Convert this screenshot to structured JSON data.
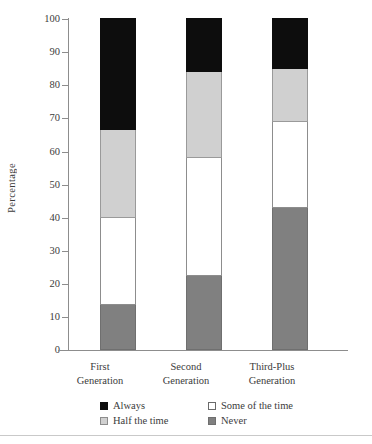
{
  "chart_data": {
    "type": "bar",
    "subtype": "stacked-bar-100",
    "title": "",
    "xlabel": "",
    "ylabel": "Percentage",
    "ylim": [
      0,
      100
    ],
    "ytick_step": 10,
    "yticks": [
      100,
      90,
      80,
      70,
      60,
      50,
      40,
      30,
      20,
      10,
      0
    ],
    "grid": false,
    "legend_position": "bottom",
    "categories": [
      "First Generation",
      "Second Generation",
      "Third-Plus Generation"
    ],
    "category_lines": [
      [
        "First",
        "Generation"
      ],
      [
        "Second",
        "Generation"
      ],
      [
        "Third-Plus",
        "Generation"
      ]
    ],
    "stack_order_bottom_to_top": [
      "Never",
      "Some of the time",
      "Half the time",
      "Always"
    ],
    "series": [
      {
        "name": "Never",
        "key": "never",
        "color": "#808080",
        "values": [
          13.5,
          22.5,
          43.0
        ]
      },
      {
        "name": "Some of the time",
        "key": "some",
        "color": "#ffffff",
        "values": [
          26.5,
          35.5,
          26.0
        ]
      },
      {
        "name": "Half the time",
        "key": "half",
        "color": "#d0d0d0",
        "values": [
          26.5,
          26.0,
          16.0
        ]
      },
      {
        "name": "Always",
        "key": "always",
        "color": "#0d0d0d",
        "values": [
          33.5,
          16.0,
          15.0
        ]
      }
    ],
    "cumulative_tops": {
      "never": [
        13.5,
        22.5,
        43.0
      ],
      "some": [
        40.0,
        58.0,
        69.0
      ],
      "half": [
        66.5,
        84.0,
        85.0
      ],
      "always": [
        100.0,
        100.0,
        100.0
      ]
    }
  },
  "axis": {
    "y_title": "Percentage",
    "tick_labels": [
      "100",
      "90",
      "80",
      "70",
      "60",
      "50",
      "40",
      "30",
      "20",
      "10",
      "0"
    ]
  },
  "legend": {
    "row1": [
      {
        "label": "Always",
        "swatch": "sw-always"
      },
      {
        "label": "Some of the time",
        "swatch": "sw-some"
      }
    ],
    "row2": [
      {
        "label": "Half the time",
        "swatch": "sw-half"
      },
      {
        "label": "Never",
        "swatch": "sw-never"
      }
    ]
  }
}
